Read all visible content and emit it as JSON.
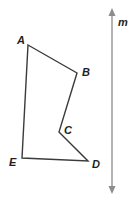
{
  "figure": {
    "background_color": "#ffffff",
    "stroke_color": "#3c3a3b",
    "label_color": "#231f20",
    "line_m_color": "#8c8c8c"
  },
  "polygon": {
    "name": "ABCDE",
    "points": "28,45 77,73 59,132 88,161 22,158",
    "path": "M28,45 L77,73 L59,132 L88,161 L22,158 Z",
    "vertices": [
      {
        "label": "A",
        "x": 28,
        "y": 45,
        "label_x": 17,
        "label_y": 44
      },
      {
        "label": "B",
        "x": 77,
        "y": 73,
        "label_x": 82,
        "label_y": 76
      },
      {
        "label": "C",
        "x": 59,
        "y": 132,
        "label_x": 64,
        "label_y": 134
      },
      {
        "label": "D",
        "x": 88,
        "y": 161,
        "label_x": 92,
        "label_y": 168
      },
      {
        "label": "E",
        "x": 22,
        "y": 158,
        "label_x": 9,
        "label_y": 166
      }
    ]
  },
  "line_m": {
    "label": "m",
    "label_x": 118,
    "label_y": 26,
    "x": 112,
    "y_top": 10,
    "y_bottom": 192,
    "arrow_top": "112,8 108.5,16 115.5,16",
    "arrow_bottom": "112,194 108.5,186 115.5,186"
  }
}
